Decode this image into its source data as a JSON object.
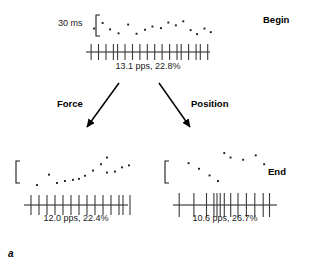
{
  "figure": {
    "panel_letter": "a",
    "scale_label": "30 ms",
    "stage_labels": {
      "begin": "Begin",
      "end": "End"
    },
    "arrows": [
      {
        "name": "force",
        "label": "Force"
      },
      {
        "name": "position",
        "label": "Position"
      }
    ]
  },
  "chart_data": {
    "type": "scatter",
    "title": "",
    "xlabel": "",
    "ylabel": "",
    "scale_bar": {
      "label": "30 ms",
      "value": 30,
      "unit": "ms"
    },
    "panels": [
      {
        "name": "begin",
        "stage": "Begin",
        "rate_label": "13.1 pps, 22.8%",
        "rate_pps": 13.1,
        "cv_percent": 22.8,
        "bracket": true,
        "interval_dots": [
          [
            4,
            44
          ],
          [
            12,
            30
          ],
          [
            19,
            46
          ],
          [
            27,
            56
          ],
          [
            36,
            34
          ],
          [
            44,
            57
          ],
          [
            52,
            47
          ],
          [
            59,
            39
          ],
          [
            67,
            43
          ],
          [
            74,
            29
          ],
          [
            81,
            36
          ],
          [
            88,
            26
          ],
          [
            95,
            48
          ],
          [
            101,
            58
          ],
          [
            108,
            44
          ],
          [
            114,
            53
          ]
        ],
        "spike_ticks": [
          2,
          9,
          16,
          23,
          27,
          34,
          41,
          48,
          55,
          62,
          69,
          76,
          83,
          87,
          94,
          101,
          105,
          112
        ]
      },
      {
        "name": "end-force",
        "stage": "End",
        "rate_label": "12.0 pps, 22.4%",
        "rate_pps": 12.0,
        "cv_percent": 22.4,
        "bracket": true,
        "interval_dots": [
          [
            10,
            56
          ],
          [
            22,
            36
          ],
          [
            30,
            52
          ],
          [
            38,
            48
          ],
          [
            46,
            46
          ],
          [
            52,
            44
          ],
          [
            58,
            38
          ],
          [
            66,
            28
          ],
          [
            74,
            16
          ],
          [
            80,
            32
          ],
          [
            88,
            30
          ],
          [
            95,
            22
          ],
          [
            102,
            18
          ],
          [
            80,
            3
          ]
        ],
        "spike_ticks": [
          5,
          13,
          21,
          29,
          37,
          45,
          53,
          61,
          69,
          77,
          85,
          93,
          97,
          104
        ]
      },
      {
        "name": "end-position",
        "stage": "End",
        "rate_label": "10.6 pps, 26.7%",
        "rate_pps": 10.6,
        "cv_percent": 26.7,
        "bracket": true,
        "interval_dots": [
          [
            12,
            20
          ],
          [
            22,
            30
          ],
          [
            32,
            42
          ],
          [
            40,
            52
          ],
          [
            46,
            2
          ],
          [
            52,
            10
          ],
          [
            64,
            14
          ],
          [
            76,
            6
          ],
          [
            84,
            22
          ]
        ],
        "spike_ticks": [
          4,
          18,
          30,
          37,
          40,
          43,
          47,
          53,
          60,
          68,
          76,
          84,
          90
        ]
      }
    ],
    "colors": {
      "dot": "#1a1a1a",
      "axis": "#1a1a1a",
      "tick": "#3a3a3a",
      "text": "#1a1a1a"
    }
  }
}
